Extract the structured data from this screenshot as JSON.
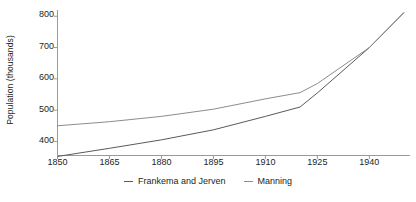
{
  "chart_data": {
    "type": "line",
    "title": "",
    "xlabel": "",
    "ylabel": "Population (thousands)",
    "xlim": [
      1850,
      1950
    ],
    "ylim": [
      355,
      820
    ],
    "xticks": [
      1850,
      1865,
      1880,
      1895,
      1910,
      1925,
      1940
    ],
    "yticks": [
      400,
      500,
      600,
      700,
      800
    ],
    "grid": false,
    "legend_position": "bottom-center",
    "series": [
      {
        "name": "Frankema and Jerven",
        "color": "#5a5a5a",
        "x": [
          1850,
          1865,
          1880,
          1895,
          1910,
          1920,
          1925,
          1940,
          1950
        ],
        "values": [
          352,
          378,
          405,
          437,
          480,
          510,
          555,
          700,
          812
        ]
      },
      {
        "name": "Manning",
        "color": "#8c8c8c",
        "x": [
          1850,
          1865,
          1880,
          1895,
          1910,
          1920,
          1925,
          1940,
          1950
        ],
        "values": [
          450,
          463,
          480,
          503,
          536,
          556,
          585,
          700,
          812
        ]
      }
    ]
  },
  "axis": {
    "y_title": "Population (thousands)",
    "y_tick_labels": [
      "800",
      "700",
      "600",
      "500",
      "400"
    ],
    "x_tick_labels": [
      "1850",
      "1865",
      "1880",
      "1895",
      "1910",
      "1925",
      "1940"
    ]
  },
  "legend": {
    "items": [
      {
        "label": "Frankema and Jerven"
      },
      {
        "label": "Manning"
      }
    ]
  },
  "colors": {
    "axis": "#9a9a9a",
    "text": "#231f20",
    "series_1": "#5a5a5a",
    "series_2": "#8c8c8c",
    "background": "#ffffff"
  }
}
